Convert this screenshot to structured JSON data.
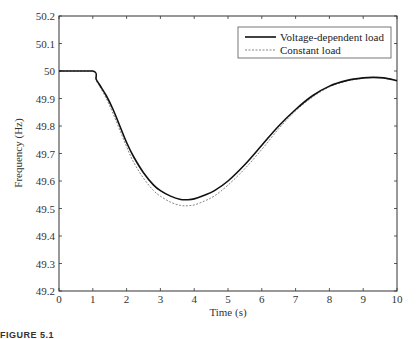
{
  "chart_data": {
    "type": "line",
    "title": "",
    "xlabel": "Time (s)",
    "ylabel": "Frequency (Hz)",
    "xlim": [
      0,
      10
    ],
    "ylim": [
      49.2,
      50.2
    ],
    "xticks": [
      0,
      1,
      2,
      3,
      4,
      5,
      6,
      7,
      8,
      9,
      10
    ],
    "yticks": [
      49.2,
      49.3,
      49.4,
      49.5,
      49.6,
      49.7,
      49.8,
      49.9,
      50,
      50.1,
      50.2
    ],
    "ytick_labels": [
      "49.2",
      "49.3",
      "49.4",
      "49.5",
      "49.6",
      "49.7",
      "49.8",
      "49.9",
      "50",
      "50.1",
      "50.2"
    ],
    "grid": false,
    "legend_position": "upper right",
    "series": [
      {
        "name": "Voltage-dependent load",
        "style": "solid",
        "color": "#111111",
        "x": [
          0,
          1.0,
          1.1,
          1.2,
          1.4,
          1.6,
          1.8,
          2.0,
          2.2,
          2.5,
          2.8,
          3.0,
          3.3,
          3.6,
          3.8,
          4.0,
          4.3,
          4.6,
          5.0,
          5.5,
          6.0,
          6.5,
          7.0,
          7.5,
          8.0,
          8.5,
          9.0,
          9.3,
          9.6,
          10.0
        ],
        "y": [
          50.0,
          50.0,
          49.97,
          49.95,
          49.91,
          49.86,
          49.8,
          49.74,
          49.69,
          49.63,
          49.585,
          49.565,
          49.545,
          49.533,
          49.532,
          49.535,
          49.548,
          49.565,
          49.6,
          49.66,
          49.73,
          49.8,
          49.86,
          49.91,
          49.945,
          49.965,
          49.975,
          49.977,
          49.975,
          49.965
        ]
      },
      {
        "name": "Constant load",
        "style": "dashed",
        "color": "#777777",
        "x": [
          0,
          1.0,
          1.1,
          1.2,
          1.4,
          1.6,
          1.8,
          2.0,
          2.2,
          2.5,
          2.8,
          3.0,
          3.3,
          3.6,
          3.8,
          4.0,
          4.3,
          4.6,
          5.0,
          5.5,
          6.0,
          6.5,
          7.0,
          7.5,
          8.0,
          8.5,
          9.0,
          9.3,
          9.6,
          10.0
        ],
        "y": [
          50.0,
          50.0,
          49.965,
          49.945,
          49.9,
          49.845,
          49.785,
          49.725,
          49.67,
          49.61,
          49.565,
          49.545,
          49.523,
          49.511,
          49.51,
          49.513,
          49.527,
          49.546,
          49.585,
          49.645,
          49.715,
          49.79,
          49.855,
          49.905,
          49.942,
          49.963,
          49.974,
          49.977,
          49.975,
          49.965
        ]
      }
    ]
  },
  "caption": "FIGURE 5.1"
}
